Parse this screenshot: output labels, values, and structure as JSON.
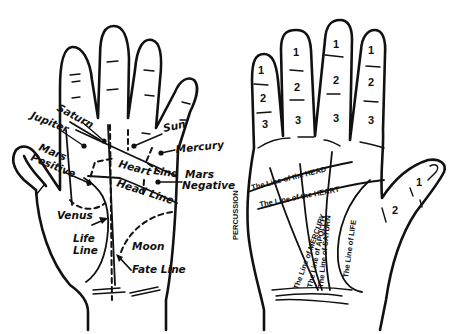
{
  "left_hand": {
    "mounts": [
      {
        "id": "saturn",
        "label": "Saturn"
      },
      {
        "id": "jupiter",
        "label": "Jupiter"
      },
      {
        "id": "sun",
        "label": "Sun"
      },
      {
        "id": "mercury",
        "label": "Mercury"
      },
      {
        "id": "mars_positive",
        "label_line1": "Mars",
        "label_line2": "Positive"
      },
      {
        "id": "mars_negative",
        "label_line1": "Mars",
        "label_line2": "Negative"
      },
      {
        "id": "venus",
        "label": "Venus"
      },
      {
        "id": "moon",
        "label": "Moon"
      }
    ],
    "lines": {
      "heart": "Heart",
      "heart_suffix": "Line",
      "head": "Head Line",
      "life_line1": "Life",
      "life_line2": "Line",
      "fate": "Fate Line"
    }
  },
  "right_hand": {
    "side_label": "PERCUSSION",
    "finger_phalanges": [
      "1",
      "2",
      "3"
    ],
    "thumb_phalanges": [
      "1",
      "2"
    ],
    "lines": {
      "head": "The Line of the HEAD",
      "heart": "The Line of the HEART",
      "mercury": "The Line of MERCURY",
      "apollo": "The Line of APOLLO",
      "saturn": "The Line of SATURN",
      "life": "The Line of LIFE"
    }
  }
}
